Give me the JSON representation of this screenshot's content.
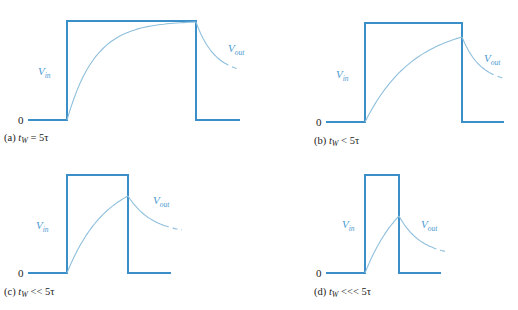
{
  "figure": {
    "colors": {
      "vin": "#3a8fc9",
      "vout": "#8fbfdc",
      "label": "#4a9ad0",
      "text": "#222222"
    },
    "panels": [
      {
        "id": "a",
        "caption_prefix": "(a) ",
        "caption_var": "t",
        "caption_sub": "W",
        "caption_rel": " = 5τ",
        "zero_label": "0",
        "vin_label": "V",
        "vin_sub": "in",
        "vout_label": "V",
        "vout_sub": "out",
        "geom": {
          "x0": 28,
          "xr": 67,
          "xf": 196,
          "x1": 240,
          "yb": 120,
          "yt": 21,
          "peak_y": 22,
          "decay_end": [
            238,
            69
          ],
          "vin_lbl": [
            38,
            75
          ],
          "vout_lbl": [
            228,
            52
          ],
          "zero": [
            18,
            124
          ],
          "cap": [
            4,
            141
          ]
        }
      },
      {
        "id": "b",
        "caption_prefix": "(b) ",
        "caption_var": "t",
        "caption_sub": "W",
        "caption_rel": " < 5τ",
        "zero_label": "0",
        "vin_label": "V",
        "vin_sub": "in",
        "vout_label": "V",
        "vout_sub": "out",
        "geom": {
          "x0": 326,
          "xr": 365,
          "xf": 462,
          "x1": 504,
          "yb": 122,
          "yt": 23,
          "peak_y": 37,
          "decay_end": [
            503,
            78
          ],
          "vin_lbl": [
            336,
            78
          ],
          "vout_lbl": [
            484,
            62
          ],
          "zero": [
            316,
            126
          ],
          "cap": [
            314,
            144
          ]
        }
      },
      {
        "id": "c",
        "caption_prefix": "(c) ",
        "caption_var": "t",
        "caption_sub": "W",
        "caption_rel": " << 5τ",
        "zero_label": "0",
        "vin_label": "V",
        "vin_sub": "in",
        "vout_label": "V",
        "vout_sub": "out",
        "geom": {
          "x0": 28,
          "xr": 67,
          "xf": 128,
          "x1": 171,
          "yb": 273,
          "yt": 175,
          "peak_y": 196,
          "decay_end": [
            182,
            230
          ],
          "vin_lbl": [
            36,
            229
          ],
          "vout_lbl": [
            153,
            204
          ],
          "zero": [
            18,
            277
          ],
          "cap": [
            4,
            295
          ]
        }
      },
      {
        "id": "d",
        "caption_prefix": "(d) ",
        "caption_var": "t",
        "caption_sub": "W",
        "caption_rel": " <<< 5τ",
        "zero_label": "0",
        "vin_label": "V",
        "vin_sub": "in",
        "vout_label": "V",
        "vout_sub": "out",
        "geom": {
          "x0": 326,
          "xr": 365,
          "xf": 399,
          "x1": 441,
          "yb": 273,
          "yt": 175,
          "peak_y": 216,
          "decay_end": [
            448,
            252
          ],
          "vin_lbl": [
            342,
            228
          ],
          "vout_lbl": [
            421,
            228
          ],
          "zero": [
            316,
            277
          ],
          "cap": [
            314,
            295
          ]
        }
      }
    ]
  }
}
